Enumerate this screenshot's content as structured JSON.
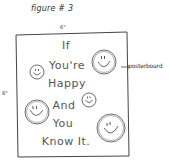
{
  "figure": {
    "title": "figure # 3",
    "width_label": "6\"",
    "height_label": "8\"",
    "callout_label": "posterboard"
  },
  "poster": {
    "lines": [
      "If",
      "You're",
      "Happy",
      "And",
      "You",
      "Know It."
    ],
    "smiley_count": 5
  },
  "colors": {
    "ink": "#444444",
    "background": "#ffffff"
  }
}
